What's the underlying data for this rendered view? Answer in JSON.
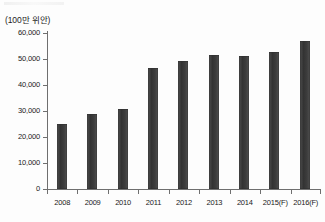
{
  "chart_data": {
    "type": "bar",
    "title": "",
    "subtitle": "",
    "xlabel": "",
    "ylabel": "(100만 위안)",
    "unit_label": "(100만 위안)",
    "categories": [
      "2008",
      "2009",
      "2010",
      "2011",
      "2012",
      "2013",
      "2014",
      "2015(F)",
      "2016(F)"
    ],
    "values": [
      25000,
      29000,
      30800,
      46500,
      49200,
      51500,
      51200,
      52700,
      57000
    ],
    "series": [
      {
        "name": "",
        "values": [
          25000,
          29000,
          30800,
          46500,
          49200,
          51500,
          51200,
          52700,
          57000
        ]
      }
    ],
    "ylim": [
      0,
      60000
    ],
    "ytick_labels": [
      "60,000",
      "50,000",
      "40,000",
      "30,000",
      "20,000",
      "10,000",
      "0"
    ],
    "ytick_values": [
      60000,
      50000,
      40000,
      30000,
      20000,
      10000,
      0
    ],
    "ytick_step": 10000,
    "grid": false,
    "legend": false,
    "legend_position": "none",
    "bar_color": "#3b3b3b",
    "axis_color": "#6f6f6f",
    "background_color": "#ffffff",
    "annotations": []
  }
}
